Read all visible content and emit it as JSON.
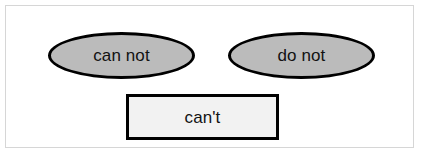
{
  "diagram": {
    "background_color": "#ffffff",
    "frame_color": "#d6d6d6",
    "nodes": [
      {
        "id": "can-not",
        "label": "can not",
        "shape": "ellipse",
        "fill": "#bbbbbb",
        "stroke": "#000000"
      },
      {
        "id": "do-not",
        "label": "do not",
        "shape": "ellipse",
        "fill": "#bbbbbb",
        "stroke": "#000000"
      },
      {
        "id": "cant",
        "label": "can't",
        "shape": "rectangle",
        "fill": "#f2f2f2",
        "stroke": "#000000"
      }
    ]
  }
}
